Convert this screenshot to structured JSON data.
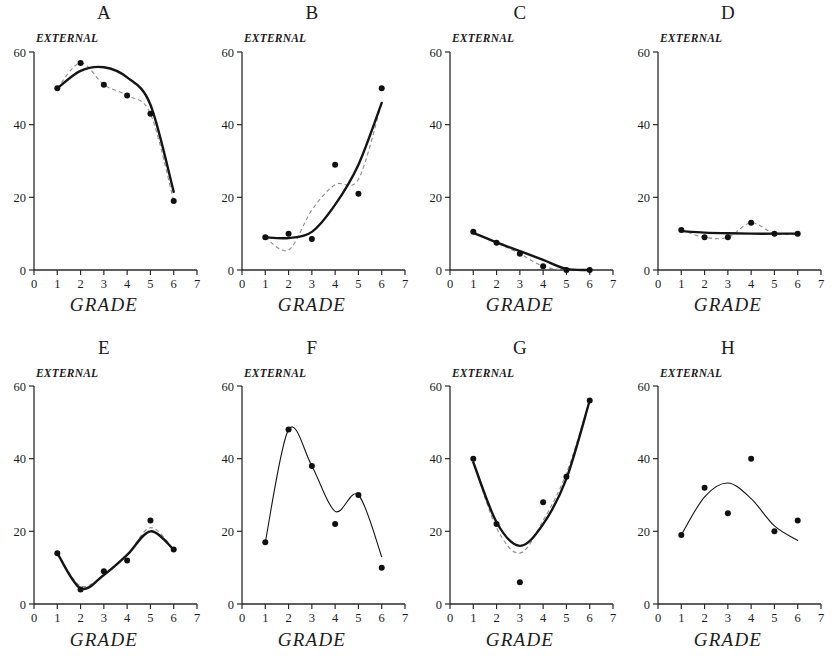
{
  "figure": {
    "axis_labels": {
      "y": "EXTERNAL",
      "x": "GRADE"
    },
    "y_ticks": [
      "0",
      "20",
      "40",
      "60"
    ],
    "y_tick_values": [
      0,
      20,
      40,
      60
    ],
    "x_ticks": [
      "0",
      "1",
      "2",
      "3",
      "4",
      "5",
      "6",
      "7"
    ],
    "x_tick_values": [
      0,
      1,
      2,
      3,
      4,
      5,
      6,
      7
    ],
    "colors": {
      "axis": "#2a2a2a",
      "point": "#101010",
      "solid_curve": "#151515",
      "dashed_curve": "#8d8d8d"
    }
  },
  "chart_data": [
    {
      "type": "scatter",
      "title": "A",
      "xlabel": "GRADE",
      "ylabel": "EXTERNAL",
      "xlim": [
        0,
        7
      ],
      "ylim": [
        0,
        60
      ],
      "grid": false,
      "legend": "none",
      "x": [
        1,
        2,
        3,
        4,
        5,
        6
      ],
      "values": [
        50,
        57,
        51,
        48,
        43,
        19
      ],
      "series": [
        {
          "name": "data points",
          "values": [
            50,
            57,
            51,
            48,
            43,
            19
          ]
        },
        {
          "name": "fitted curve (solid)",
          "style": "solid",
          "values": [
            50.0,
            54.8,
            55.8,
            53.0,
            45.5,
            21.5
          ]
        },
        {
          "name": "fitted curve (dashed)",
          "style": "dashed",
          "values": [
            50,
            57,
            51,
            48,
            43,
            19
          ]
        }
      ]
    },
    {
      "type": "scatter",
      "title": "B",
      "xlabel": "GRADE",
      "ylabel": "EXTERNAL",
      "xlim": [
        0,
        7
      ],
      "ylim": [
        0,
        60
      ],
      "grid": false,
      "legend": "none",
      "x": [
        1,
        2,
        3,
        4,
        5,
        6
      ],
      "values": [
        9,
        10,
        8.5,
        29,
        21,
        50
      ],
      "series": [
        {
          "name": "data points",
          "values": [
            9,
            10,
            8.5,
            29,
            21,
            50
          ]
        },
        {
          "name": "fitted curve (solid)",
          "style": "solid",
          "values": [
            9.0,
            8.8,
            10.5,
            18.0,
            29.0,
            46.0
          ]
        },
        {
          "name": "fitted curve (dashed)",
          "style": "dashed",
          "values": [
            9,
            5.5,
            16.5,
            23.5,
            25.0,
            46.0
          ]
        }
      ]
    },
    {
      "type": "scatter",
      "title": "C",
      "xlabel": "GRADE",
      "ylabel": "EXTERNAL",
      "xlim": [
        0,
        7
      ],
      "ylim": [
        0,
        60
      ],
      "grid": false,
      "legend": "none",
      "x": [
        1,
        2,
        3,
        4,
        5,
        6
      ],
      "values": [
        10.5,
        7.5,
        4.5,
        1,
        0,
        0
      ],
      "series": [
        {
          "name": "data points",
          "values": [
            10.5,
            7.5,
            4.5,
            1,
            0,
            0
          ]
        },
        {
          "name": "fitted curve (solid)",
          "style": "solid",
          "values": [
            10.2,
            7.6,
            5.2,
            2.8,
            0.3,
            0
          ]
        },
        {
          "name": "fitted curve (dashed)",
          "style": "dashed",
          "values": [
            10.5,
            7.5,
            4.5,
            1.0,
            0,
            0
          ]
        }
      ]
    },
    {
      "type": "scatter",
      "title": "D",
      "xlabel": "GRADE",
      "ylabel": "EXTERNAL",
      "xlim": [
        0,
        7
      ],
      "ylim": [
        0,
        60
      ],
      "grid": false,
      "legend": "none",
      "x": [
        1,
        2,
        3,
        4,
        5,
        6
      ],
      "values": [
        11,
        9,
        9,
        13,
        10,
        10
      ],
      "series": [
        {
          "name": "data points",
          "values": [
            11,
            9,
            9,
            13,
            10,
            10
          ]
        },
        {
          "name": "fitted curve (solid)",
          "style": "solid",
          "values": [
            10.7,
            10.3,
            10.1,
            10.0,
            10.0,
            10.0
          ]
        },
        {
          "name": "fitted curve (dashed)",
          "style": "dashed",
          "values": [
            11,
            9,
            9,
            13,
            10,
            10
          ]
        }
      ]
    },
    {
      "type": "scatter",
      "title": "E",
      "xlabel": "GRADE",
      "ylabel": "EXTERNAL",
      "xlim": [
        0,
        7
      ],
      "ylim": [
        0,
        60
      ],
      "grid": false,
      "legend": "none",
      "x": [
        1,
        2,
        3,
        4,
        5,
        6
      ],
      "values": [
        14,
        4,
        9,
        12,
        23,
        15
      ],
      "series": [
        {
          "name": "data points",
          "values": [
            14,
            4,
            9,
            12,
            23,
            15
          ]
        },
        {
          "name": "fitted curve (solid)",
          "style": "solid",
          "values": [
            14.0,
            4.3,
            8.0,
            13.5,
            20.0,
            15.0
          ]
        },
        {
          "name": "fitted curve (dashed)",
          "style": "dashed",
          "values": [
            14.0,
            5.0,
            8.0,
            13.5,
            21.0,
            15.0
          ]
        }
      ]
    },
    {
      "type": "scatter",
      "title": "F",
      "xlabel": "GRADE",
      "ylabel": "EXTERNAL",
      "xlim": [
        0,
        7
      ],
      "ylim": [
        0,
        60
      ],
      "grid": false,
      "legend": "none",
      "x": [
        1,
        2,
        3,
        4,
        5,
        6
      ],
      "values": [
        17,
        48,
        38,
        22,
        30,
        10
      ],
      "series": [
        {
          "name": "data points",
          "values": [
            17,
            48,
            38,
            22,
            30,
            10
          ]
        },
        {
          "name": "fitted curve (solid)",
          "style": "solid",
          "values": [
            17.0,
            48.0,
            38.0,
            25.5,
            30.0,
            13.0
          ]
        }
      ]
    },
    {
      "type": "scatter",
      "title": "G",
      "xlabel": "GRADE",
      "ylabel": "EXTERNAL",
      "xlim": [
        0,
        7
      ],
      "ylim": [
        0,
        60
      ],
      "grid": false,
      "legend": "none",
      "x": [
        1,
        2,
        3,
        4,
        5,
        6
      ],
      "values": [
        40,
        22,
        6,
        28,
        35,
        56
      ],
      "series": [
        {
          "name": "data points",
          "values": [
            40,
            22,
            6,
            28,
            35,
            56
          ]
        },
        {
          "name": "fitted curve (solid)",
          "style": "solid",
          "values": [
            39.0,
            22.5,
            16.0,
            22.0,
            34.5,
            56.0
          ]
        },
        {
          "name": "fitted curve (dashed)",
          "style": "dashed",
          "values": [
            39.0,
            21.0,
            14.0,
            23.0,
            36.0,
            56.0
          ]
        }
      ]
    },
    {
      "type": "scatter",
      "title": "H",
      "xlabel": "GRADE",
      "ylabel": "EXTERNAL",
      "xlim": [
        0,
        7
      ],
      "ylim": [
        0,
        60
      ],
      "grid": false,
      "legend": "none",
      "x": [
        1,
        2,
        3,
        4,
        5,
        6
      ],
      "values": [
        19,
        32,
        25,
        40,
        20,
        23
      ],
      "series": [
        {
          "name": "data points",
          "values": [
            19,
            32,
            25,
            40,
            20,
            23
          ]
        },
        {
          "name": "fitted curve (solid)",
          "style": "solid",
          "values": [
            19.0,
            29.5,
            33.3,
            29.0,
            21.5,
            17.5
          ]
        }
      ]
    }
  ]
}
